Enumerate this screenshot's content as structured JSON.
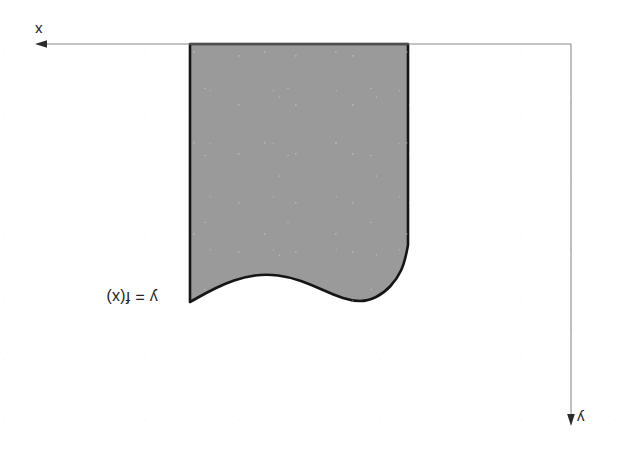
{
  "figure": {
    "kind": "math-region-under-curve",
    "orientation_note": "upside-down",
    "background_color": "#ffffff",
    "fill_color": "#9a9a9a",
    "outline_color": "#151515",
    "axis_color": "#8a8a8a",
    "label_color": "#232323",
    "width": 618,
    "height": 460
  },
  "labels": {
    "x_axis": "x",
    "y_axis": "y",
    "curve": "y = f(x)"
  },
  "chart_data": {
    "type": "line",
    "title": "",
    "xlabel": "x",
    "ylabel": "y",
    "legend": [
      "y = f(x)"
    ],
    "grid": false,
    "orientation": "rotated-180",
    "axes": {
      "x_axis_line": {
        "from": [
          36,
          44
        ],
        "to": [
          571,
          44
        ],
        "arrow_at": "from",
        "arrow_direction": "left"
      },
      "y_axis_line": {
        "from": [
          571,
          44
        ],
        "to": [
          571,
          425
        ],
        "arrow_at": "to",
        "arrow_direction": "down"
      }
    },
    "region": {
      "description": "shaded region bounded above by the baseline axis and below by the curve y = f(x)",
      "left_x": 190,
      "right_x": 408,
      "baseline_y": 44,
      "curve_points": [
        [
          190,
          302
        ],
        [
          206,
          293
        ],
        [
          224,
          284
        ],
        [
          244,
          277
        ],
        [
          266,
          274
        ],
        [
          290,
          277
        ],
        [
          312,
          285
        ],
        [
          334,
          295
        ],
        [
          352,
          301
        ],
        [
          368,
          301
        ],
        [
          384,
          293
        ],
        [
          397,
          279
        ],
        [
          405,
          262
        ],
        [
          408,
          245
        ]
      ]
    }
  }
}
